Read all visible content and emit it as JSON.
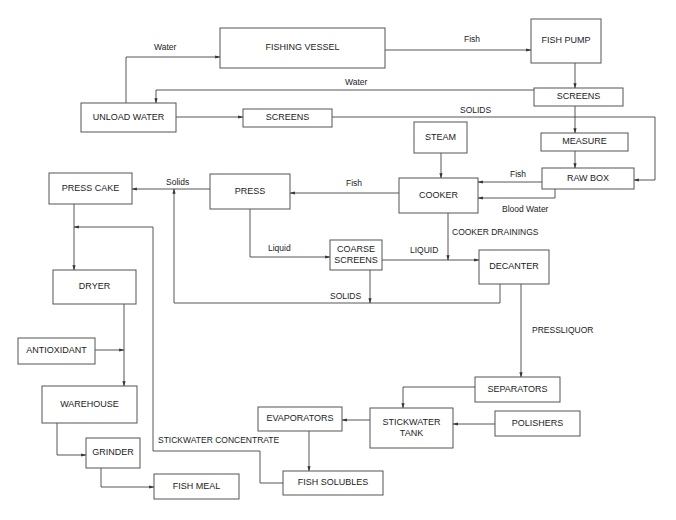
{
  "diagram": {
    "nodes": [
      {
        "id": "fishing_vessel",
        "label": "FISHING VESSEL",
        "x": 220,
        "y": 28,
        "w": 165,
        "h": 40
      },
      {
        "id": "fish_pump",
        "label": "FISH  PUMP",
        "x": 531,
        "y": 19,
        "w": 70,
        "h": 44
      },
      {
        "id": "unload_water",
        "label": "UNLOAD WATER",
        "x": 81,
        "y": 103,
        "w": 95,
        "h": 29
      },
      {
        "id": "screens1",
        "label": "SCREENS",
        "x": 243,
        "y": 109,
        "w": 89,
        "h": 18
      },
      {
        "id": "screens2",
        "label": "SCREENS",
        "x": 534,
        "y": 88,
        "w": 89,
        "h": 18
      },
      {
        "id": "steam",
        "label": "STEAM",
        "x": 414,
        "y": 122,
        "w": 53,
        "h": 31
      },
      {
        "id": "measure",
        "label": "MEASURE",
        "x": 541,
        "y": 133,
        "w": 87,
        "h": 18
      },
      {
        "id": "raw_box",
        "label": "RAW BOX",
        "x": 542,
        "y": 168,
        "w": 92,
        "h": 21
      },
      {
        "id": "press_cake",
        "label": "PRESS CAKE",
        "x": 49,
        "y": 173,
        "w": 83,
        "h": 31
      },
      {
        "id": "press",
        "label": "PRESS",
        "x": 210,
        "y": 174,
        "w": 80,
        "h": 35
      },
      {
        "id": "cooker",
        "label": "COOKER",
        "x": 399,
        "y": 178,
        "w": 79,
        "h": 35
      },
      {
        "id": "coarse_screens",
        "label": "COARSE\nSCREENS",
        "x": 330,
        "y": 240,
        "w": 52,
        "h": 30
      },
      {
        "id": "decanter",
        "label": "DECANTER",
        "x": 479,
        "y": 250,
        "w": 70,
        "h": 34
      },
      {
        "id": "dryer",
        "label": "DRYER",
        "x": 53,
        "y": 270,
        "w": 83,
        "h": 34
      },
      {
        "id": "antioxidant",
        "label": "ANTIOXIDANT",
        "x": 18,
        "y": 338,
        "w": 77,
        "h": 26
      },
      {
        "id": "warehouse",
        "label": "WAREHOUSE",
        "x": 42,
        "y": 386,
        "w": 95,
        "h": 37
      },
      {
        "id": "separators",
        "label": "SEPARATORS",
        "x": 475,
        "y": 377,
        "w": 85,
        "h": 25
      },
      {
        "id": "evaporators",
        "label": "EVAPORATORS",
        "x": 258,
        "y": 407,
        "w": 84,
        "h": 24
      },
      {
        "id": "stickwater_tank",
        "label": "STICKWATER\nTANK",
        "x": 370,
        "y": 408,
        "w": 83,
        "h": 40
      },
      {
        "id": "polishers",
        "label": "POLISHERS",
        "x": 495,
        "y": 411,
        "w": 85,
        "h": 25
      },
      {
        "id": "grinder",
        "label": "GRINDER",
        "x": 86,
        "y": 438,
        "w": 54,
        "h": 30
      },
      {
        "id": "fish_solubles",
        "label": "FISH SOLUBLES",
        "x": 283,
        "y": 471,
        "w": 100,
        "h": 24
      },
      {
        "id": "fish_meal",
        "label": "FISH MEAL",
        "x": 154,
        "y": 474,
        "w": 85,
        "h": 25
      }
    ],
    "edge_labels": [
      {
        "text": "Water",
        "x": 154,
        "y": 50
      },
      {
        "text": "Fish",
        "x": 464,
        "y": 42
      },
      {
        "text": "Water",
        "x": 345,
        "y": 85
      },
      {
        "text": "SOLIDS",
        "x": 460,
        "y": 113
      },
      {
        "text": "Fish",
        "x": 510,
        "y": 177
      },
      {
        "text": "Solids",
        "x": 166,
        "y": 185
      },
      {
        "text": "Fish",
        "x": 346,
        "y": 186
      },
      {
        "text": "Blood Water",
        "x": 502,
        "y": 212
      },
      {
        "text": "COOKER DRAININGS",
        "x": 452,
        "y": 235
      },
      {
        "text": "Liquid",
        "x": 268,
        "y": 251
      },
      {
        "text": "LIQUID",
        "x": 410,
        "y": 253
      },
      {
        "text": "SOLIDS",
        "x": 330,
        "y": 299
      },
      {
        "text": "PRESSLIQUOR",
        "x": 532,
        "y": 333
      },
      {
        "text": "STICKWATER CONCENTRATE",
        "x": 158,
        "y": 443
      }
    ]
  }
}
